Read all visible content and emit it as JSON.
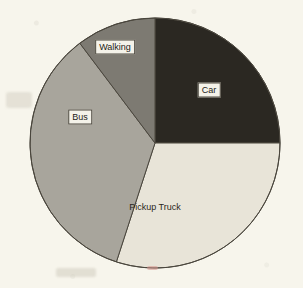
{
  "title": {
    "text": "Transport mode to work (cropped title)",
    "visible_fragment": ""
  },
  "chart_data": {
    "type": "pie",
    "title": "",
    "xlabel": "",
    "ylabel": "",
    "legend_position": "none",
    "labels_inside": true,
    "start_angle_deg": 0,
    "direction": "clockwise",
    "center": {
      "x": 155,
      "y": 143
    },
    "radius": 125,
    "categories": [
      "Car",
      "Pickup Truck",
      "Bus",
      "Walking"
    ],
    "values": [
      25,
      30,
      35,
      10
    ],
    "units": "percent",
    "slices": [
      {
        "label": "Car",
        "value": 25,
        "start_deg": 0,
        "end_deg": 90,
        "color": "#2b2822",
        "label_boxed": true,
        "label_x": 209,
        "label_y": 90
      },
      {
        "label": "Pickup Truck",
        "value": 30,
        "start_deg": 90,
        "end_deg": 198,
        "color": "#e8e4d8",
        "label_boxed": false,
        "label_x": 155,
        "label_y": 207
      },
      {
        "label": "Bus",
        "value": 35,
        "start_deg": 198,
        "end_deg": 323,
        "color": "#a8a59c",
        "label_boxed": true,
        "label_x": 80,
        "label_y": 117
      },
      {
        "label": "Walking",
        "value": 10,
        "start_deg": 323,
        "end_deg": 360,
        "color": "#7d7a72",
        "label_boxed": true,
        "label_x": 115,
        "label_y": 47
      }
    ]
  },
  "colors": {
    "background": "#f7f5ec",
    "outline": "#4a463d",
    "text": "#1d1b16",
    "car": "#2b2822",
    "pickup_truck": "#e8e4d8",
    "bus": "#a8a59c",
    "walking": "#7d7a72"
  }
}
